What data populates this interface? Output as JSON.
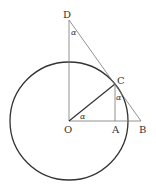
{
  "diagram": {
    "title": "",
    "colors": {
      "stroke": "#333333",
      "thin_stroke": "#777777",
      "background": "#ffffff"
    },
    "circle": {
      "cx": 69,
      "cy": 121,
      "r": 59
    },
    "points": {
      "O": {
        "label": "O",
        "x": 69,
        "y": 121
      },
      "A": {
        "label": "A",
        "x": 115,
        "y": 121
      },
      "B": {
        "label": "B",
        "x": 141,
        "y": 121
      },
      "C": {
        "label": "C",
        "x": 115,
        "y": 84
      },
      "D": {
        "label": "D",
        "x": 69,
        "y": 20
      }
    },
    "segments": [
      {
        "from": "O",
        "to": "D"
      },
      {
        "from": "O",
        "to": "B"
      },
      {
        "from": "O",
        "to": "C"
      },
      {
        "from": "C",
        "to": "A"
      },
      {
        "from": "D",
        "to": "B"
      }
    ],
    "angle_labels": [
      {
        "vertex": "D",
        "text": "α"
      },
      {
        "vertex": "C",
        "text": "α"
      },
      {
        "vertex": "O",
        "text": "α"
      }
    ]
  }
}
